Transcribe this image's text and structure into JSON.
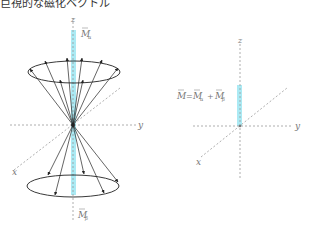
{
  "title": "巨視的な磁化ベクトル",
  "colors": {
    "axis": "#9a9a9a",
    "arrow": "#222222",
    "highlight": "#8fe3f0"
  },
  "left_diagram": {
    "axis_labels": {
      "z": "z",
      "y": "y",
      "x": "x"
    },
    "top_label": "M⃗α",
    "bottom_label": "M⃗β",
    "top_label_main": "M",
    "top_label_sub": "α",
    "bottom_label_main": "M",
    "bottom_label_sub": "β"
  },
  "right_diagram": {
    "axis_labels": {
      "z": "z",
      "y": "y",
      "x": "x"
    },
    "equation": "M⃗ = M⃗α + M⃗β",
    "eq_parts": {
      "m": "M",
      "eq": "=",
      "ma": "M",
      "a": "α",
      "plus": "+",
      "mb": "M",
      "b": "β"
    }
  }
}
